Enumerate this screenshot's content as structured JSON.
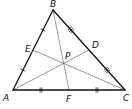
{
  "diagram": {
    "title": "",
    "type": "triangle-medians-centroid",
    "colors": {
      "stroke": "#111111",
      "median": "#555555",
      "background": "#ffffff"
    },
    "vertices": [
      {
        "id": "A",
        "label": "A",
        "x": 13,
        "y": 90,
        "label_x": 3,
        "label_y": 101
      },
      {
        "id": "B",
        "label": "B",
        "x": 53,
        "y": 10,
        "label_x": 50,
        "label_y": 7
      },
      {
        "id": "C",
        "label": "C",
        "x": 125,
        "y": 90,
        "label_x": 123,
        "label_y": 101
      }
    ],
    "midpoints": [
      {
        "id": "E",
        "label": "E",
        "on_side": "AB",
        "x": 33,
        "y": 50,
        "label_x": 25,
        "label_y": 52
      },
      {
        "id": "D",
        "label": "D",
        "on_side": "BC",
        "x": 89,
        "y": 50,
        "label_x": 92,
        "label_y": 48
      },
      {
        "id": "F",
        "label": "F",
        "on_side": "AC",
        "x": 69,
        "y": 90,
        "label_x": 66,
        "label_y": 102
      }
    ],
    "centroid": {
      "id": "P",
      "label": "P",
      "x": 64,
      "y": 63,
      "label_x": 65,
      "label_y": 59
    },
    "medians": [
      {
        "from": "A",
        "to": "D"
      },
      {
        "from": "B",
        "to": "F"
      },
      {
        "from": "C",
        "to": "E"
      }
    ],
    "tick_marks": [
      {
        "segment": "AE",
        "count": 1
      },
      {
        "segment": "EB",
        "count": 1
      },
      {
        "segment": "BD",
        "count": 3
      },
      {
        "segment": "DC",
        "count": 3
      },
      {
        "segment": "AF",
        "count": 2
      },
      {
        "segment": "FC",
        "count": 2
      }
    ]
  }
}
